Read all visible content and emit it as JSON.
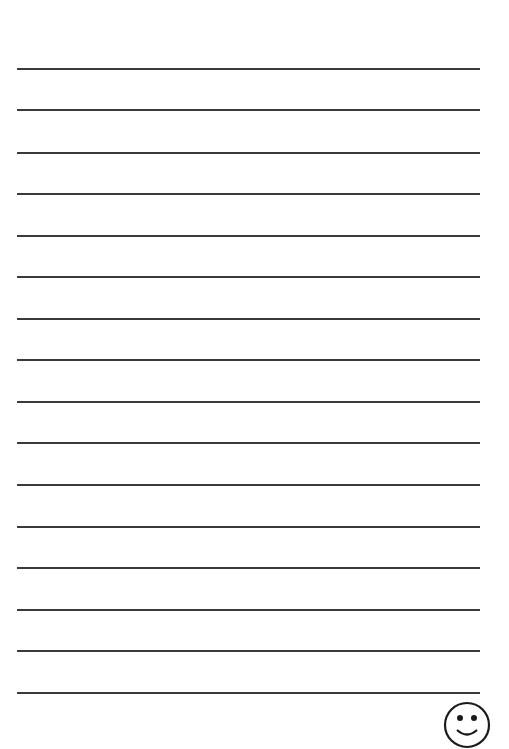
{
  "page": {
    "type": "lined-paper",
    "background": "#ffffff",
    "line_color": "#3a3a3a",
    "line_count": 16,
    "lines_y": [
      69,
      110,
      153,
      194,
      236,
      277,
      319,
      360,
      402,
      443,
      485,
      527,
      568,
      610,
      651,
      693
    ],
    "line_x_start": 17,
    "line_x_end": 480
  },
  "decoration": {
    "icon": "smiley-face-icon"
  }
}
